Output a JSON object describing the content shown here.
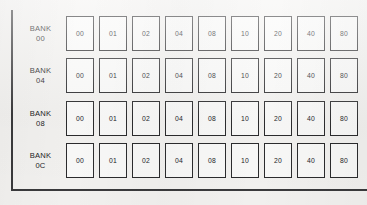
{
  "diagram": {
    "column_values": [
      "00",
      "01",
      "02",
      "04",
      "08",
      "10",
      "20",
      "40",
      "80"
    ],
    "colors": {
      "background": "#f4f3f1",
      "rule": "#3a3a3c",
      "cell_border": "#2c2c2e",
      "cell_fill": "#fbfbfa",
      "text": "#1d1d1f"
    },
    "rows": [
      {
        "label_name": "BANK",
        "label_id": "00",
        "cells": [
          "00",
          "01",
          "02",
          "04",
          "08",
          "10",
          "20",
          "40",
          "80"
        ]
      },
      {
        "label_name": "BANK",
        "label_id": "04",
        "cells": [
          "00",
          "01",
          "02",
          "04",
          "08",
          "10",
          "20",
          "40",
          "80"
        ]
      },
      {
        "label_name": "BANK",
        "label_id": "08",
        "cells": [
          "00",
          "01",
          "02",
          "04",
          "08",
          "10",
          "20",
          "40",
          "80"
        ]
      },
      {
        "label_name": "BANK",
        "label_id": "0C",
        "cells": [
          "00",
          "01",
          "02",
          "04",
          "08",
          "10",
          "20",
          "40",
          "80"
        ]
      }
    ]
  }
}
